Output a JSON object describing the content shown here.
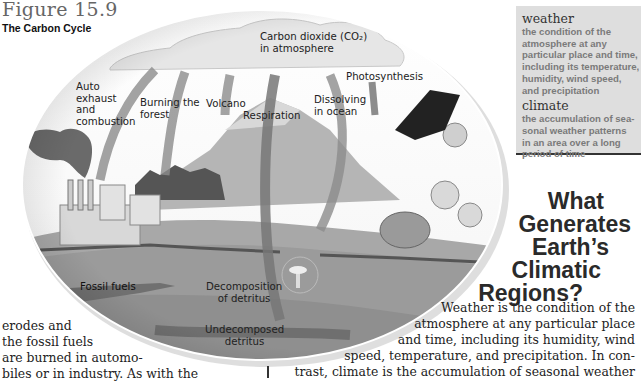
{
  "figure": {
    "number": "Figure 15.9",
    "title": "The Carbon Cycle"
  },
  "diagram_labels": {
    "auto_exhaust": [
      "Auto",
      "exhaust",
      "and",
      "combustion"
    ],
    "burning_forest": [
      "Burning the",
      "forest"
    ],
    "volcano": "Volcano",
    "co2_atmosphere": [
      "Carbon dioxide (CO₂)",
      "in atmosphere"
    ],
    "respiration": "Respiration",
    "dissolving_ocean": [
      "Dissolving",
      "in ocean"
    ],
    "photosynthesis": "Photosynthesis",
    "fossil_fuels": "Fossil fuels",
    "decomposition": [
      "Decomposition",
      "of detritus"
    ],
    "undecomposed": [
      "Undecomposed",
      "detritus"
    ]
  },
  "glossary": [
    {
      "term": "weather",
      "definition": [
        "the condition of the",
        "atmosphere at any",
        "particular place and time,",
        "including its temperature,",
        "humidity, wind speed,",
        "and precipitation"
      ]
    },
    {
      "term": "climate",
      "definition": [
        "the accumulation of sea-",
        "sonal weather patterns",
        "in an area over a long",
        "period of time"
      ]
    }
  ],
  "section_heading": [
    "What",
    "Generates",
    "Earth’s",
    "Climatic",
    "Regions?"
  ],
  "body_right": [
    "Weather is the condition of the",
    "atmosphere at any particular place",
    "and  time,  including  its  humidity,  wind",
    "speed, temperature, and precipitation. In con-",
    "trast, climate is the accumulation of seasonal weather"
  ],
  "body_left": [
    "erodes     and",
    "the  fossil  fuels",
    "are burned in automo-",
    "biles or in industry. As with the"
  ],
  "colors": {
    "sidebar_bg": "#dedede",
    "definition_text": "#7a7a7a",
    "heading_text": "#2a2a2a"
  }
}
